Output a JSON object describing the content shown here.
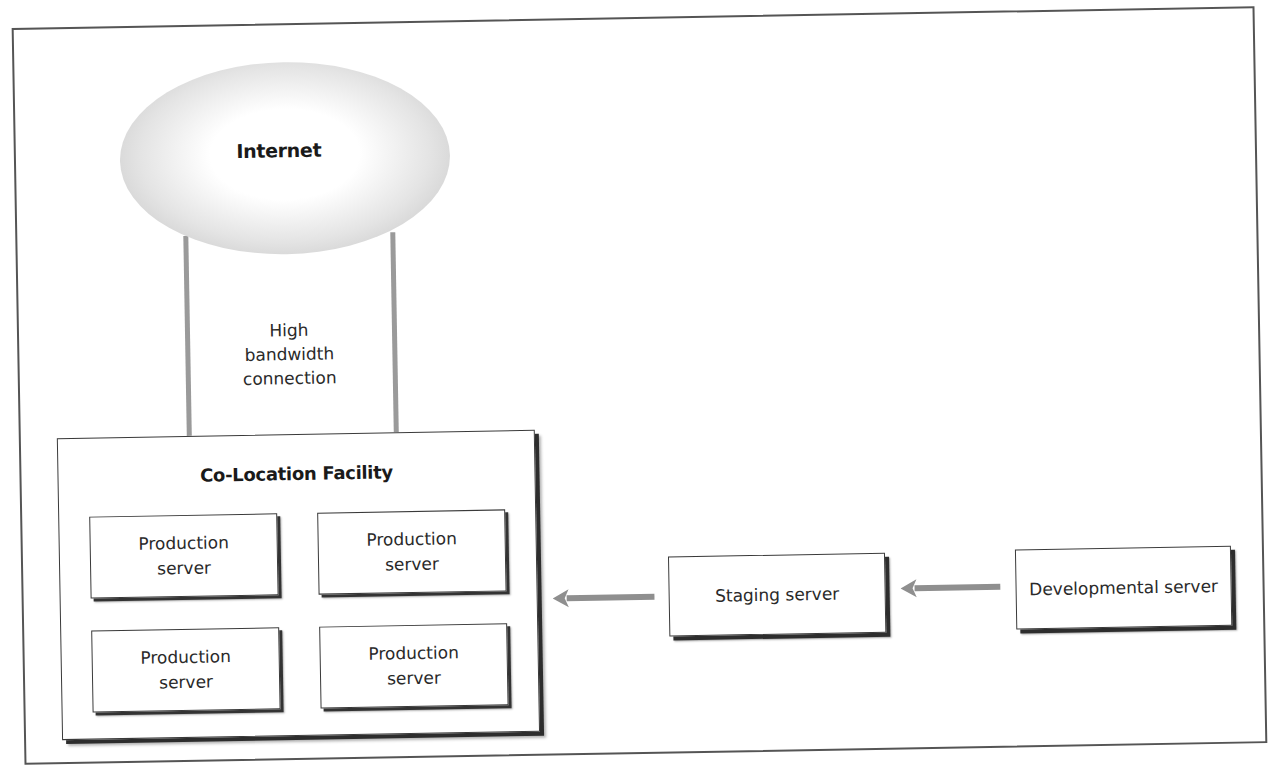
{
  "diagram": {
    "colors": {
      "border": "#3a3a3a",
      "connector": "#9a9a9a",
      "arrow": "#8f8f8f",
      "cloud_edge": "#b9b9b9",
      "background": "#ffffff"
    },
    "cloud": {
      "label": "Internet",
      "icon": "cloud-ellipse-icon"
    },
    "connection": {
      "label_lines": [
        "High",
        "bandwidth",
        "connection"
      ]
    },
    "facility": {
      "title": "Co-Location Facility",
      "servers": [
        {
          "line1": "Production",
          "line2": "server"
        },
        {
          "line1": "Production",
          "line2": "server"
        },
        {
          "line1": "Production",
          "line2": "server"
        },
        {
          "line1": "Production",
          "line2": "server"
        }
      ]
    },
    "staging": {
      "label": "Staging server"
    },
    "developmental": {
      "label": "Developmental server"
    },
    "arrows": [
      {
        "from": "Staging server",
        "to": "Co-Location Facility",
        "direction": "left"
      },
      {
        "from": "Developmental server",
        "to": "Staging server",
        "direction": "left"
      }
    ]
  }
}
